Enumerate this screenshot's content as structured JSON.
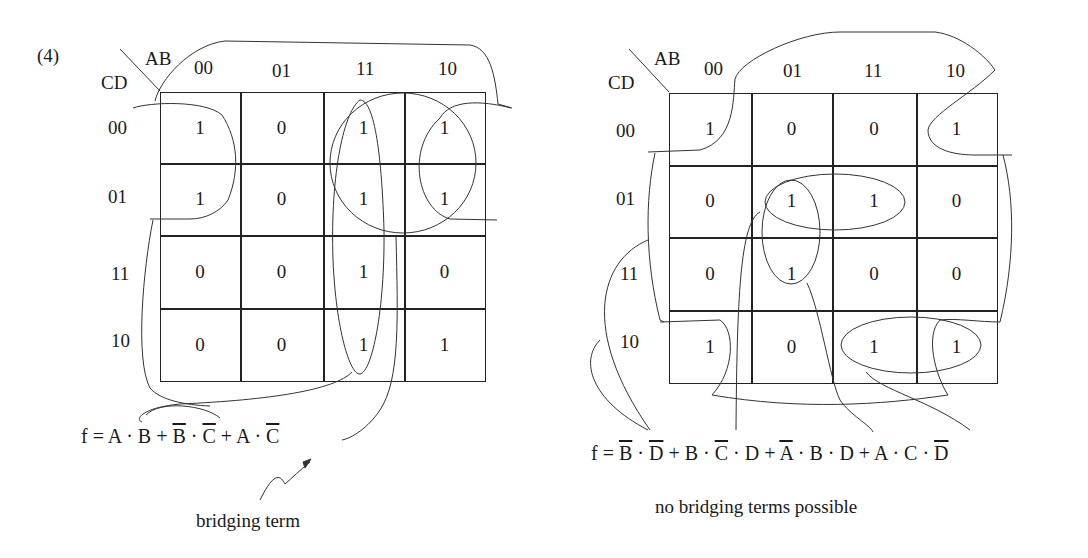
{
  "problem_label": "(4)",
  "kmaps": [
    {
      "id": "left",
      "corner": {
        "top": "AB",
        "left": "CD"
      },
      "col_headers": [
        "00",
        "01",
        "11",
        "10"
      ],
      "row_headers": [
        "00",
        "01",
        "11",
        "10"
      ],
      "cells": [
        [
          "1",
          "0",
          "1",
          "1"
        ],
        [
          "1",
          "0",
          "1",
          "1"
        ],
        [
          "0",
          "0",
          "1",
          "0"
        ],
        [
          "0",
          "0",
          "1",
          "1"
        ]
      ],
      "equation": {
        "prefix": "f = ",
        "terms": [
          {
            "parts": [
              {
                "t": "A",
                "bar": false
              },
              {
                "t": " · ",
                "bar": false
              },
              {
                "t": "B",
                "bar": false
              }
            ]
          },
          {
            "parts": [
              {
                "t": "B",
                "bar": true
              },
              {
                "t": " · ",
                "bar": false
              },
              {
                "t": "C",
                "bar": true
              }
            ]
          },
          {
            "parts": [
              {
                "t": "A",
                "bar": false
              },
              {
                "t": " · ",
                "bar": false
              },
              {
                "t": "C",
                "bar": true
              }
            ]
          }
        ]
      },
      "annotation": "bridging term"
    },
    {
      "id": "right",
      "corner": {
        "top": "AB",
        "left": "CD"
      },
      "col_headers": [
        "00",
        "01",
        "11",
        "10"
      ],
      "row_headers": [
        "00",
        "01",
        "11",
        "10"
      ],
      "cells": [
        [
          "1",
          "0",
          "0",
          "1"
        ],
        [
          "0",
          "1",
          "1",
          "0"
        ],
        [
          "0",
          "1",
          "0",
          "0"
        ],
        [
          "1",
          "0",
          "1",
          "1"
        ]
      ],
      "equation": {
        "prefix": "f = ",
        "terms": [
          {
            "parts": [
              {
                "t": "B",
                "bar": true
              },
              {
                "t": " · ",
                "bar": false
              },
              {
                "t": "D",
                "bar": true
              }
            ]
          },
          {
            "parts": [
              {
                "t": "B",
                "bar": false
              },
              {
                "t": " · ",
                "bar": false
              },
              {
                "t": "C",
                "bar": true
              },
              {
                "t": " · ",
                "bar": false
              },
              {
                "t": "D",
                "bar": false
              }
            ]
          },
          {
            "parts": [
              {
                "t": "A",
                "bar": true
              },
              {
                "t": " · ",
                "bar": false
              },
              {
                "t": "B",
                "bar": false
              },
              {
                "t": " · ",
                "bar": false
              },
              {
                "t": "D",
                "bar": false
              }
            ]
          },
          {
            "parts": [
              {
                "t": "A",
                "bar": false
              },
              {
                "t": " · ",
                "bar": false
              },
              {
                "t": "C",
                "bar": false
              },
              {
                "t": " · ",
                "bar": false
              },
              {
                "t": "D",
                "bar": true
              }
            ]
          }
        ]
      },
      "annotation": "no bridging terms possible"
    }
  ],
  "layout": {
    "left": {
      "x": [
        160,
        240,
        323,
        404,
        485
      ],
      "y": [
        92,
        163,
        235,
        308,
        381
      ]
    },
    "right": {
      "x": [
        669,
        751,
        832,
        916,
        997
      ],
      "y": [
        93,
        165,
        237,
        310,
        383
      ]
    }
  }
}
